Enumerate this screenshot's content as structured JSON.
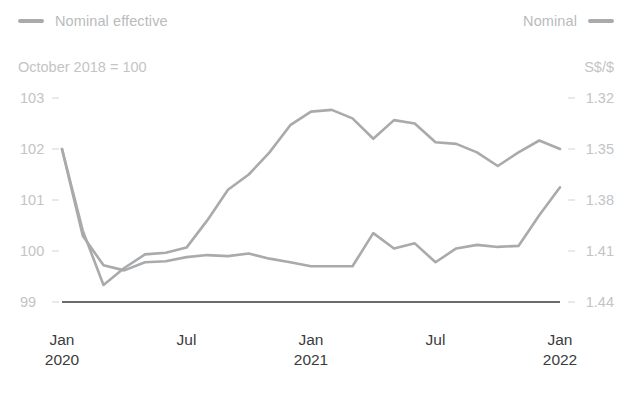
{
  "legend": {
    "left": {
      "label": "Nominal effective",
      "color": "#a8aaac",
      "swatch": "legend-swatch-nominal-effective"
    },
    "right": {
      "label": "Nominal",
      "color": "#a8aaac",
      "swatch": "legend-swatch-nominal"
    }
  },
  "captions": {
    "left": "October 2018 = 100",
    "right": "S$/$"
  },
  "chart_data": {
    "type": "line",
    "title": "",
    "subtitle": "October 2018 = 100",
    "xlabel": "",
    "ylabel": "October 2018 = 100",
    "y2label": "S$/$",
    "grid": false,
    "legend_position": "top",
    "x": [
      "Jan 2020",
      "Feb 2020",
      "Mar 2020",
      "Apr 2020",
      "May 2020",
      "Jun 2020",
      "Jul 2020",
      "Aug 2020",
      "Sep 2020",
      "Oct 2020",
      "Nov 2020",
      "Dec 2020",
      "Jan 2021",
      "Feb 2021",
      "Mar 2021",
      "Apr 2021",
      "May 2021",
      "Jun 2021",
      "Jul 2021",
      "Aug 2021",
      "Sep 2021",
      "Oct 2021",
      "Nov 2021",
      "Dec 2021",
      "Jan 2022"
    ],
    "xticks": [
      "Jan",
      "Jul",
      "Jan",
      "Jul",
      "Jan"
    ],
    "xtick_years": [
      "2020",
      "",
      "2021",
      "",
      "2022"
    ],
    "xtick_positions": [
      0,
      6,
      12,
      18,
      24
    ],
    "yticks": [
      103,
      102,
      101,
      100,
      99
    ],
    "ylim": [
      99,
      103
    ],
    "y2ticks": [
      "1.32",
      "1.35",
      "1.38",
      "1.41",
      "1.44"
    ],
    "y2lim": [
      1.44,
      1.32
    ],
    "y2_inverted": true,
    "series": [
      {
        "name": "Nominal effective",
        "axis": "left",
        "color": "#a8aaac",
        "units": "index (October 2018 = 100)",
        "values": [
          102.0,
          100.3,
          99.72,
          99.62,
          99.78,
          99.8,
          99.88,
          99.92,
          99.9,
          99.95,
          99.85,
          99.78,
          99.7,
          99.7,
          99.7,
          100.35,
          100.05,
          100.15,
          99.78,
          100.05,
          100.12,
          100.08,
          100.1,
          100.7,
          101.25
        ]
      },
      {
        "name": "Nominal",
        "axis": "right",
        "color": "#a8aaac",
        "units": "S$ per US$",
        "values": [
          1.35,
          1.398,
          1.43,
          1.42,
          1.412,
          1.411,
          1.408,
          1.392,
          1.374,
          1.365,
          1.352,
          1.336,
          1.328,
          1.327,
          1.332,
          1.344,
          1.333,
          1.335,
          1.346,
          1.347,
          1.352,
          1.36,
          1.352,
          1.345,
          1.35
        ]
      }
    ],
    "annotations": []
  },
  "axis": {
    "baseline_color": "#3b3b3d",
    "tick_color": "#d2d4d6",
    "label_color": "#c2c4c6",
    "xlabel_color": "#3b3b3d"
  }
}
